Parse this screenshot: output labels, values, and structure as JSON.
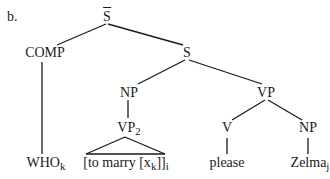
{
  "example_label": "b.",
  "tree": {
    "root": {
      "label": "S",
      "bar": true
    },
    "comp": {
      "label": "COMP"
    },
    "s": {
      "label": "S"
    },
    "np_subject": {
      "label": "NP"
    },
    "vp": {
      "label": "VP"
    },
    "vp2": {
      "label": "VP",
      "subscript": "2"
    },
    "v": {
      "label": "V"
    },
    "np_object": {
      "label": "NP"
    },
    "leaves": {
      "who": {
        "text": "WHO",
        "subscript": "k"
      },
      "infinitive": {
        "text_before": "[to marry [x",
        "inner_subscript": "k",
        "text_after": "]]",
        "outer_subscript": "i"
      },
      "please": {
        "text": "please"
      },
      "zelma": {
        "text": "Zelma",
        "subscript": "j"
      }
    }
  },
  "colors": {
    "ink": "#1a1a1a",
    "background": "#ffffff"
  }
}
